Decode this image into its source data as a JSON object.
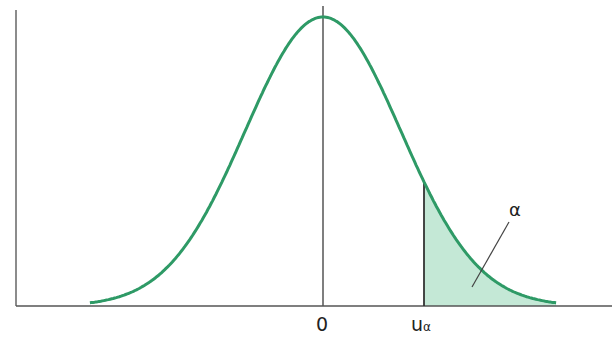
{
  "chart_data": {
    "type": "area",
    "title": "",
    "xlabel": "",
    "ylabel": "",
    "x_ticks": [
      {
        "value": 0,
        "label": "0"
      },
      {
        "value": 1.3,
        "label": "u",
        "subscript": "α"
      }
    ],
    "annotations": [
      {
        "text": "α",
        "target": "shaded right tail area"
      }
    ],
    "series": [
      {
        "name": "density",
        "function": "N(0,1)",
        "x_range": [
          -3,
          3
        ]
      }
    ],
    "shaded_region": {
      "from": 1.3,
      "to": 3,
      "label": "α"
    },
    "grid": false,
    "legend": null,
    "colors": {
      "curve": "#2e9a66",
      "fill": "#bfe6d3",
      "axis": "#555555"
    }
  },
  "labels": {
    "zero": "0",
    "u": "u",
    "u_sub": "α",
    "alpha": "α"
  }
}
